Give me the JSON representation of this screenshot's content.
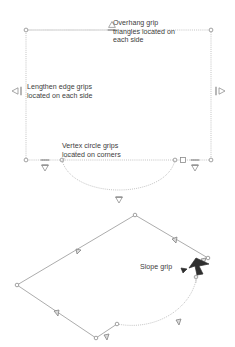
{
  "figure": {
    "background_color": "#ffffff",
    "line_color": "#9a9a9a",
    "grip_color": "#8d8d8d",
    "text_color": "#3d3d3d",
    "dark_grip_color": "#333333"
  },
  "annotations": {
    "overhang": {
      "label": "Overhang grip\ntriangles located on\neach side",
      "glyph": "triangle-up",
      "glyph_char": "△"
    },
    "lengthen": {
      "label": "Lengthen edge grips\nlocated on each side",
      "glyph": "triangle-left",
      "glyph_char": "◁"
    },
    "vertex": {
      "label": "Vertex circle grips\nlocated on corners",
      "glyph": "circle",
      "glyph_char": "○"
    },
    "slope": {
      "label": "Slope grip",
      "glyph": "arrow-pointer",
      "glyph_char": "⮛"
    }
  },
  "views": {
    "plan": {
      "name": "plan-view",
      "vertex_grips": 4,
      "edge_grips": 4,
      "overhang_grips": 4
    },
    "iso": {
      "name": "isometric-view",
      "vertex_grips": 5,
      "edge_grips": 6,
      "slope_grips": 1
    }
  }
}
